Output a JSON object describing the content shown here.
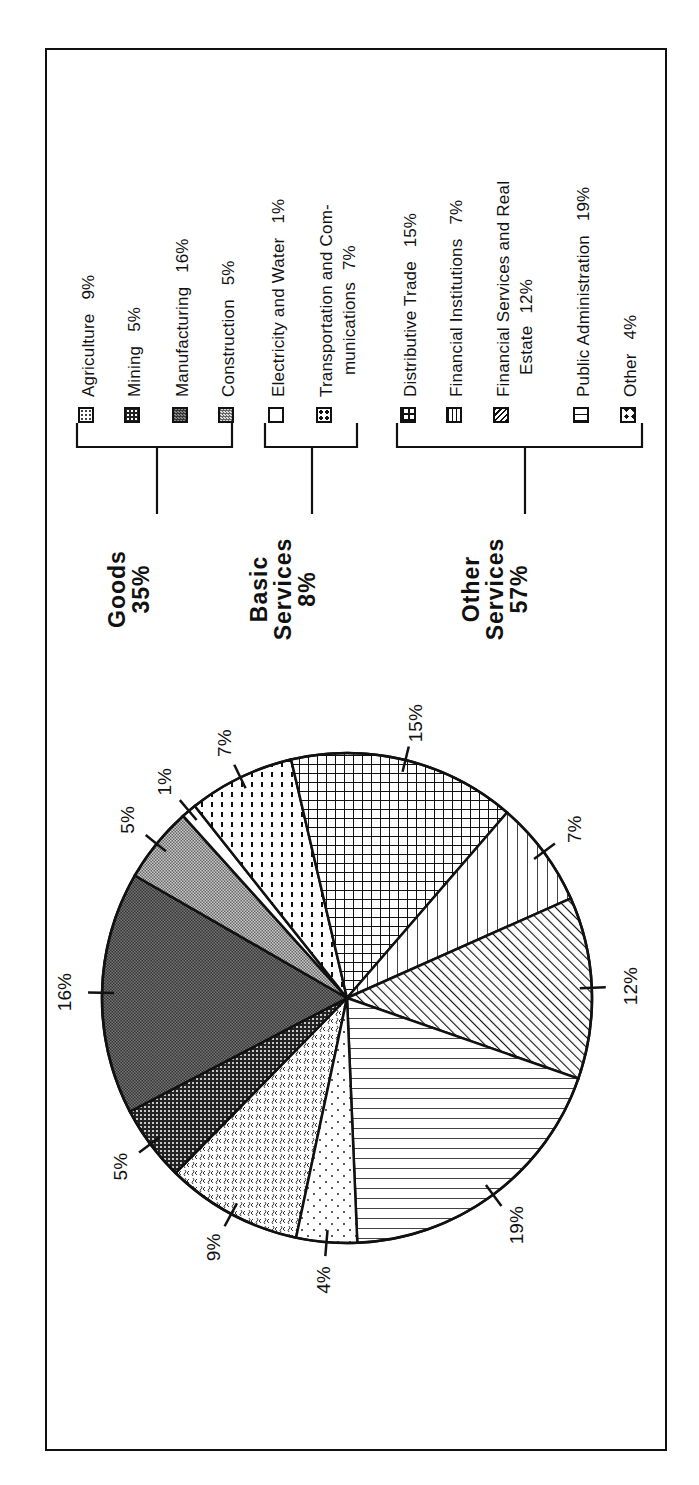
{
  "chart_data": {
    "type": "pie",
    "title": "",
    "orientation": "rotated -90deg (text reads bottom-to-top)",
    "categories": [
      "Agriculture",
      "Mining",
      "Manufacturing",
      "Construction",
      "Electricity and Water",
      "Transportation and Communications",
      "Distributive Trade",
      "Financial Institutions",
      "Financial Services and Real Estate",
      "Public Administration",
      "Other"
    ],
    "values": [
      9,
      5,
      16,
      5,
      1,
      7,
      15,
      7,
      12,
      19,
      4
    ],
    "unit": "%",
    "slice_labels": [
      "9%",
      "5%",
      "16%",
      "5%",
      "1%",
      "7%",
      "15%",
      "7%",
      "12%",
      "19%",
      "4%"
    ],
    "groups": [
      {
        "name": "Goods",
        "value": 35,
        "members": [
          "Agriculture",
          "Mining",
          "Manufacturing",
          "Construction"
        ]
      },
      {
        "name": "Basic Services",
        "value": 8,
        "members": [
          "Electricity and Water",
          "Transportation and Communications"
        ]
      },
      {
        "name": "Other Services",
        "value": 57,
        "members": [
          "Distributive Trade",
          "Financial Institutions",
          "Financial Services and Real Estate",
          "Public Administration",
          "Other"
        ]
      }
    ],
    "legend_position": "right (of rotated chart)"
  },
  "legend": {
    "items": [
      {
        "label": "Agriculture",
        "pct": "9%",
        "pattern": "squiggle-dots"
      },
      {
        "label": "Mining",
        "pct": "5%",
        "pattern": "dense-dark-dots"
      },
      {
        "label": "Manufacturing",
        "pct": "16%",
        "pattern": "dark-checker"
      },
      {
        "label": "Construction",
        "pct": "5%",
        "pattern": "light-checker"
      },
      {
        "label": "Electricity and Water",
        "pct": "1%",
        "pattern": "blank"
      },
      {
        "label": "Transportation and Com-",
        "label2": "munications",
        "pct": "7%",
        "pattern": "dotted-columns"
      },
      {
        "label": "Distributive Trade",
        "pct": "15%",
        "pattern": "grid"
      },
      {
        "label": "Financial Institutions",
        "pct": "7%",
        "pattern": "vertical-lines"
      },
      {
        "label": "Financial Services and Real",
        "label2": "Estate",
        "pct": "12%",
        "pattern": "diagonal-lines"
      },
      {
        "label": "Public Administration",
        "pct": "19%",
        "pattern": "horizontal-lines"
      },
      {
        "label": "Other",
        "pct": "4%",
        "pattern": "sparse-dots"
      }
    ]
  },
  "groups": {
    "goods": {
      "line1": "Goods",
      "line2": "35%"
    },
    "basic": {
      "line1": "Basic",
      "line2": "Services",
      "line3": "8%"
    },
    "other": {
      "line1": "Other",
      "line2": "Services",
      "line3": "57%"
    }
  },
  "slice_labels": {
    "agriculture": "9%",
    "mining": "5%",
    "manufacturing": "16%",
    "construction": "5%",
    "electricity": "1%",
    "transport": "7%",
    "distributive": "15%",
    "fin_inst": "7%",
    "fin_svc": "12%",
    "public_admin": "19%",
    "other": "4%"
  },
  "page_fragment": "24"
}
